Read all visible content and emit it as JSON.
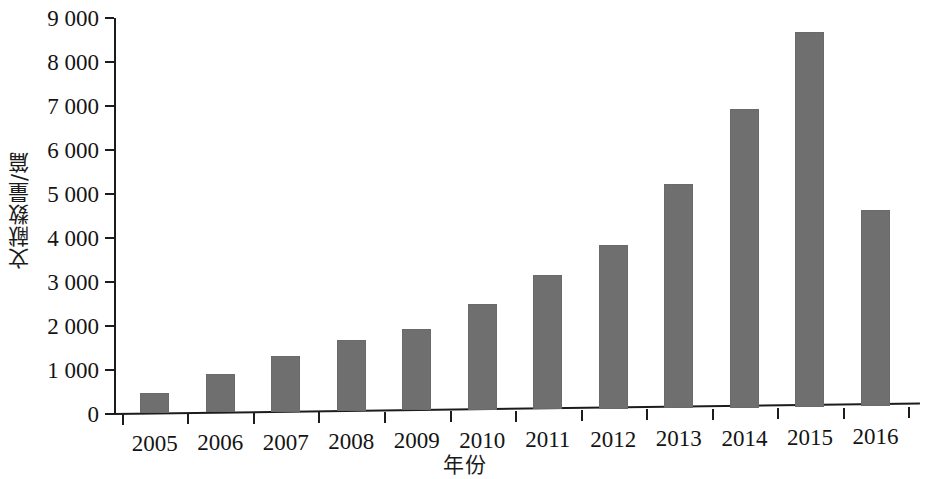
{
  "chart_data": {
    "type": "bar",
    "title": "",
    "subtitle": "",
    "xlabel": "年份",
    "ylabel": "文献数量/篇",
    "categories": [
      "2005",
      "2006",
      "2007",
      "2008",
      "2009",
      "2010",
      "2011",
      "2012",
      "2013",
      "2014",
      "2015",
      "2016"
    ],
    "values": [
      450,
      890,
      1300,
      1650,
      1920,
      2480,
      3130,
      3820,
      5210,
      6920,
      8650,
      4620
    ],
    "series": [
      {
        "name": "文献数量/篇",
        "values": [
          450,
          890,
          1300,
          1650,
          1920,
          2480,
          3130,
          3820,
          5210,
          6920,
          8650,
          4620
        ]
      }
    ],
    "ylim": [
      0,
      9000
    ],
    "ytick_values": [
      0,
      1000,
      2000,
      3000,
      4000,
      5000,
      6000,
      7000,
      8000,
      9000
    ],
    "ytick_labels": [
      "0",
      "1 000",
      "2 000",
      "3 000",
      "4 000",
      "5 000",
      "6 000",
      "7 000",
      "8 000",
      "9 000"
    ],
    "grid": false,
    "legend": false,
    "legend_position": "none",
    "bar_color": "#6f6f6f",
    "axis_color": "#1c1c1c",
    "background_color": "#ffffff"
  }
}
